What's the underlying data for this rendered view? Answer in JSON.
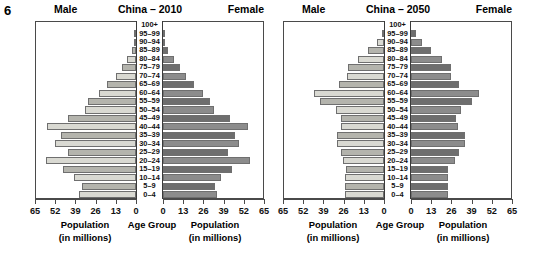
{
  "figure_number": "6",
  "panels": [
    {
      "id": "2010",
      "title": "China – 2010",
      "left_label": "Male",
      "right_label": "Female",
      "caption_male_line1": "Population",
      "caption_male_line2": "(in millions)",
      "caption_center": "Age Group",
      "caption_female_line1": "Population",
      "caption_female_line2": "(in millions)"
    },
    {
      "id": "2050",
      "title": "China – 2050",
      "left_label": "Male",
      "right_label": "Female",
      "caption_male_line1": "Population",
      "caption_male_line2": "(in millions)",
      "caption_center": "Age Group",
      "caption_female_line1": "Population",
      "caption_female_line2": "(in millions)"
    }
  ],
  "age_groups": [
    "100+",
    "95–99",
    "90–94",
    "85–89",
    "80–84",
    "75–79",
    "70–74",
    "65–69",
    "60–64",
    "55–59",
    "50–54",
    "45–49",
    "40–44",
    "35–39",
    "30–34",
    "25–29",
    "20–24",
    "15–19",
    "10–14",
    "5–9",
    "0–4"
  ],
  "x_ticks_left": [
    "65",
    "52",
    "39",
    "26",
    "13",
    "0"
  ],
  "x_ticks_right": [
    "0",
    "13",
    "26",
    "39",
    "52",
    "65"
  ],
  "colors": {
    "bar_light": "#d9d9d2",
    "bar_mid": "#b4b4ad",
    "bar_dark": "#8c8c8c",
    "bar_darkest": "#6e6e6e",
    "outline": "#6f6f6f",
    "axis": "#4a4a4a",
    "text": "#000000"
  },
  "chart_data": {
    "type": "bar",
    "subtype": "population-pyramid",
    "xlabel": "Population (in millions)",
    "ylabel": "Age Group",
    "xlim": [
      0,
      65
    ],
    "xticks": [
      0,
      13,
      26,
      39,
      52,
      65
    ],
    "grid": false,
    "legend": "none",
    "categories": [
      "100+",
      "95–99",
      "90–94",
      "85–89",
      "80–84",
      "75–79",
      "70–74",
      "65–69",
      "60–64",
      "55–59",
      "50–54",
      "45–49",
      "40–44",
      "35–39",
      "30–34",
      "25–29",
      "20–24",
      "15–19",
      "10–14",
      "5–9",
      "0–4"
    ],
    "panels": [
      {
        "name": "China – 2010",
        "series": [
          {
            "name": "Male",
            "side": "left",
            "units": "millions",
            "values": [
              0.0,
              0.3,
              1.0,
              2.5,
              5.5,
              9.0,
              13.0,
              18.5,
              24.0,
              31.0,
              33.0,
              44.0,
              57.0,
              48.0,
              52.0,
              44.0,
              58.0,
              47.0,
              40.0,
              35.0,
              37.0
            ]
          },
          {
            "name": "Female",
            "side": "right",
            "units": "millions",
            "values": [
              0.0,
              0.5,
              1.6,
              3.5,
              7.0,
              11.0,
              14.5,
              20.0,
              26.0,
              30.5,
              32.5,
              43.0,
              55.0,
              46.5,
              49.0,
              42.0,
              56.0,
              44.5,
              37.5,
              33.5,
              35.0
            ]
          }
        ]
      },
      {
        "name": "China – 2050",
        "series": [
          {
            "name": "Male",
            "side": "left",
            "units": "millions",
            "values": [
              0.0,
              1.5,
              4.5,
              10.0,
              17.0,
              23.0,
              23.5,
              29.0,
              45.0,
              41.0,
              31.0,
              27.5,
              28.0,
              30.0,
              30.0,
              28.0,
              26.5,
              24.5,
              25.0,
              25.0,
              25.0
            ]
          },
          {
            "name": "Female",
            "side": "right",
            "units": "millions",
            "values": [
              0.0,
              3.0,
              7.0,
              13.0,
              20.0,
              25.5,
              25.5,
              31.0,
              44.0,
              39.0,
              32.0,
              29.0,
              30.0,
              35.0,
              34.5,
              31.0,
              28.5,
              24.0,
              24.0,
              24.0,
              24.0
            ]
          }
        ]
      }
    ]
  }
}
